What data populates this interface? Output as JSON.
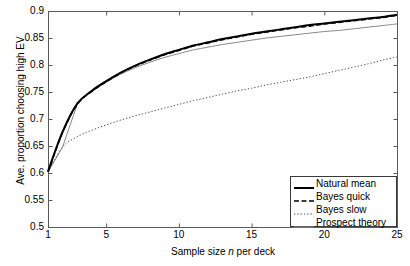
{
  "chart_data": {
    "type": "line",
    "title": "",
    "xlabel": "Sample size n per deck",
    "xlabel_plain": "Sample size ",
    "xlabel_italic": "n",
    "xlabel_tail": " per deck",
    "ylabel": "Ave. proportion choosing high EV",
    "xlim": [
      1,
      25
    ],
    "ylim": [
      0.5,
      0.9
    ],
    "grid": false,
    "legend_position": "lower right",
    "xticks": [
      1,
      5,
      10,
      15,
      20,
      25
    ],
    "xtick_labels": [
      "1",
      "5",
      "10",
      "15",
      "20",
      "25"
    ],
    "yticks": [
      0.5,
      0.55,
      0.6,
      0.65,
      0.7,
      0.75,
      0.8,
      0.85,
      0.9
    ],
    "ytick_labels": [
      "0.5",
      "0.55",
      "0.6",
      "0.65",
      "0.7",
      "0.75",
      "0.8",
      "0.85",
      "0.9"
    ],
    "x": [
      1,
      2,
      3,
      4,
      5,
      6,
      7,
      8,
      9,
      10,
      11,
      12,
      13,
      14,
      15,
      16,
      17,
      18,
      19,
      20,
      21,
      22,
      23,
      24,
      25
    ],
    "series": [
      {
        "name": "Natural mean",
        "style": "solid",
        "color": "#000000",
        "width": 2.0,
        "values": [
          0.603,
          0.676,
          0.728,
          0.752,
          0.77,
          0.786,
          0.799,
          0.81,
          0.82,
          0.828,
          0.836,
          0.842,
          0.848,
          0.853,
          0.858,
          0.862,
          0.866,
          0.87,
          0.874,
          0.877,
          0.88,
          0.883,
          0.886,
          0.889,
          0.893
        ]
      },
      {
        "name": "Bayes quick",
        "style": "dashed",
        "color": "#000000",
        "width": 1.6,
        "values": [
          0.602,
          0.675,
          0.727,
          0.751,
          0.769,
          0.785,
          0.798,
          0.809,
          0.819,
          0.827,
          0.835,
          0.841,
          0.847,
          0.852,
          0.857,
          0.861,
          0.865,
          0.869,
          0.872,
          0.876,
          0.879,
          0.882,
          0.885,
          0.888,
          0.892
        ]
      },
      {
        "name": "Bayes slow",
        "style": "dotted",
        "color": "#4a4a4a",
        "width": 1.0,
        "values": [
          0.602,
          0.648,
          0.667,
          0.679,
          0.689,
          0.698,
          0.706,
          0.713,
          0.72,
          0.727,
          0.734,
          0.74,
          0.746,
          0.752,
          0.757,
          0.763,
          0.768,
          0.773,
          0.778,
          0.784,
          0.79,
          0.796,
          0.802,
          0.809,
          0.815
        ]
      },
      {
        "name": "Prospect theory",
        "style": "solid",
        "color": "#8a8a8a",
        "width": 1.0,
        "values": [
          0.602,
          0.648,
          0.726,
          0.75,
          0.768,
          0.783,
          0.795,
          0.805,
          0.814,
          0.821,
          0.828,
          0.833,
          0.838,
          0.842,
          0.846,
          0.85,
          0.853,
          0.856,
          0.859,
          0.862,
          0.864,
          0.867,
          0.87,
          0.873,
          0.876
        ]
      }
    ],
    "legend": [
      {
        "label": "Natural mean",
        "style": "solid",
        "color": "#000000",
        "width": 2.0
      },
      {
        "label": "Bayes quick",
        "style": "dashed",
        "color": "#000000",
        "width": 1.6
      },
      {
        "label": "Bayes slow",
        "style": "dotted",
        "color": "#4a4a4a",
        "width": 1.0
      },
      {
        "label": "Prospect theory",
        "style": "solid",
        "color": "#8a8a8a",
        "width": 1.0
      }
    ],
    "axis_color": "#5a5a5a"
  }
}
